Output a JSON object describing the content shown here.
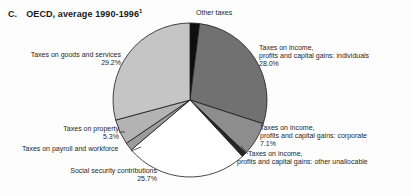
{
  "title": {
    "index": "C.",
    "text": "OECD, average 1990-1996",
    "footnote_marker": "1"
  },
  "colors": {
    "outline": "#1a1a1a",
    "background": "#fdfdfd"
  },
  "chart_data": {
    "type": "pie",
    "legend": "none",
    "labels_layout": "outside-callouts",
    "start_angle_deg": 0,
    "direction": "clockwise",
    "slices": [
      {
        "key": "other-taxes",
        "label": "Other taxes",
        "value": 2.0,
        "pct_shown": "",
        "color": "#0e0e0e"
      },
      {
        "key": "income-individuals",
        "label": "Taxes on income, profits and capital gains: individuals",
        "value": 28.0,
        "pct_shown": "28.0%",
        "color": "#717171"
      },
      {
        "key": "income-corporate",
        "label": "Taxes on income, profits and capital gains: corporate",
        "value": 7.1,
        "pct_shown": "7.1%",
        "color": "#8d8d8d"
      },
      {
        "key": "income-unallocable",
        "label": "Taxes on income, profits and capital gains: other unallocable",
        "value": 1.0,
        "pct_shown": "",
        "color": "#262626"
      },
      {
        "key": "social-security",
        "label": "Social security contributions",
        "value": 25.7,
        "pct_shown": "25.7%",
        "color": "#ffffff"
      },
      {
        "key": "payroll",
        "label": "Taxes on payroll and workforce",
        "value": 1.7,
        "pct_shown": "",
        "color": "#9c9c9c"
      },
      {
        "key": "property",
        "label": "Taxes on property",
        "value": 5.3,
        "pct_shown": "5.3%",
        "color": "#b3b3b3"
      },
      {
        "key": "goods-services",
        "label": "Taxes on goods and services",
        "value": 29.2,
        "pct_shown": "29.2%",
        "color": "#c5c5c5"
      }
    ]
  },
  "labels": {
    "other_taxes": "Other taxes",
    "goods": "Taxes on goods and services\n29.2%",
    "individuals": "Taxes on income,\nprofits and capital gains: individuals\n28.0%",
    "corporate": "Taxes on income,\nprofits and capital gains: corporate\n7.1%",
    "unallocable": "Taxes on income,\nprofits and capital gains: other unallocable",
    "property": "Taxes on property\n5.3%",
    "payroll": "Taxes on payroll and workforce",
    "social": "Social security contributions\n25.7%"
  }
}
